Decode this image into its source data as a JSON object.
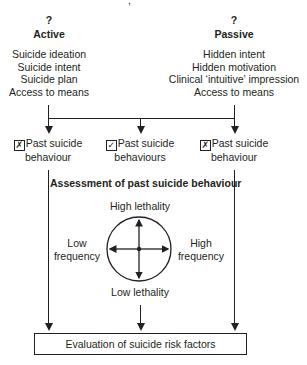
{
  "top_fragment": ",",
  "active": {
    "marker": "?",
    "title": "Active",
    "items": [
      "Suicide ideation",
      "Suicide intent",
      "Suicide plan",
      "Access to means"
    ]
  },
  "passive": {
    "marker": "?",
    "title": "Passive",
    "items": [
      "Hidden intent",
      "Hidden motivation",
      "Clinical ‘intuitive’ impression",
      "Access to means"
    ]
  },
  "branches": [
    {
      "check": "✗",
      "line1": "Past suicide",
      "line2": "behaviour"
    },
    {
      "check": "✓",
      "line1": "Past suicide",
      "line2": "behaviours"
    },
    {
      "check": "✗",
      "line1": "Past suicide",
      "line2": "behaviour"
    }
  ],
  "assessment": {
    "title": "Assessment of past suicide behaviour",
    "top": "High lethality",
    "bottom": "Low lethality",
    "left_1": "Low",
    "left_2": "frequency",
    "right_1": "High",
    "right_2": "frequency"
  },
  "evaluation": {
    "label": "Evaluation of suicide risk factors"
  },
  "colors": {
    "line": "#231f20",
    "background": "#ffffff"
  }
}
